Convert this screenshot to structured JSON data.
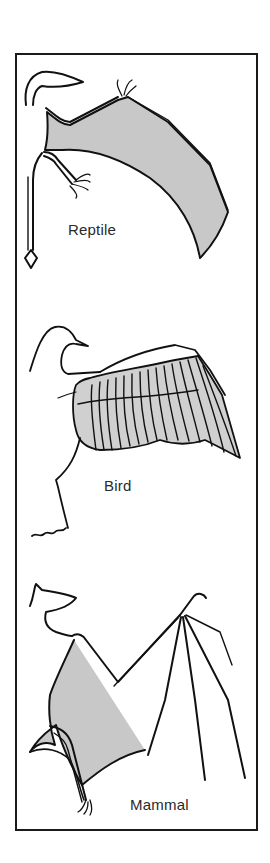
{
  "figure": {
    "colors": {
      "outline": "#111111",
      "membrane_fill": "#c8c8c8",
      "feather_fill": "#d0d0d0",
      "background": "#ffffff",
      "label_text": "#2a2a2a"
    },
    "panels": [
      {
        "id": "reptile",
        "label": "Reptile"
      },
      {
        "id": "bird",
        "label": "Bird"
      },
      {
        "id": "mammal",
        "label": "Mammal"
      }
    ]
  }
}
